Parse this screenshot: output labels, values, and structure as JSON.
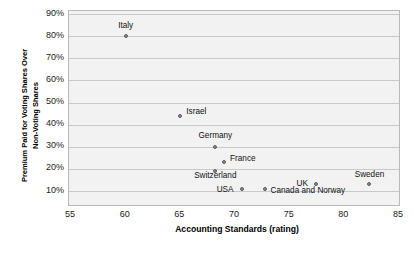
{
  "chart_data": {
    "type": "scatter",
    "title": "",
    "xlabel": "Accounting Standards (rating)",
    "ylabel_line1": "Premium Paid for Voting Shares Over",
    "ylabel_line2": "Non-Voting Shares",
    "xlim": [
      55,
      85
    ],
    "ylim": [
      0,
      90
    ],
    "xticks": [
      "55",
      "60",
      "65",
      "70",
      "75",
      "80",
      "85"
    ],
    "xtick_values": [
      55,
      60,
      65,
      70,
      75,
      80,
      85
    ],
    "yticks": [
      "10%",
      "20%",
      "30%",
      "40%",
      "50%",
      "60%",
      "70%",
      "80%",
      "90%"
    ],
    "ytick_values": [
      10,
      20,
      30,
      40,
      50,
      60,
      70,
      80,
      90
    ],
    "grid": "horizontal",
    "legend": "none",
    "marker_color": "#8a8a8a",
    "plot_background": "#f2f2f2",
    "points": [
      {
        "label": "Italy",
        "x": 60.0,
        "y": 80,
        "label_dx": 0,
        "label_dy": -11,
        "align": "center"
      },
      {
        "label": "Israel",
        "x": 65.0,
        "y": 44,
        "label_dx": 6,
        "label_dy": -4,
        "align": "left"
      },
      {
        "label": "Germany",
        "x": 68.2,
        "y": 30,
        "label_dx": 0,
        "label_dy": -11,
        "align": "center"
      },
      {
        "label": "France",
        "x": 69.0,
        "y": 23,
        "label_dx": 6,
        "label_dy": -4,
        "align": "left"
      },
      {
        "label": "Switzerland",
        "x": 68.2,
        "y": 19,
        "label_dx": 0,
        "label_dy": 4,
        "align": "center"
      },
      {
        "label": "USA",
        "x": 70.6,
        "y": 11,
        "label_dx": -8,
        "label_dy": 1,
        "align": "right"
      },
      {
        "label": "Canada and Norway",
        "x": 72.7,
        "y": 11,
        "label_dx": 6,
        "label_dy": 2,
        "align": "left"
      },
      {
        "label": "UK",
        "x": 77.4,
        "y": 13,
        "label_dx": -8,
        "label_dy": -1,
        "align": "right"
      },
      {
        "label": "Sweden",
        "x": 82.3,
        "y": 13,
        "label_dx": 0,
        "label_dy": -10,
        "align": "center"
      }
    ]
  }
}
